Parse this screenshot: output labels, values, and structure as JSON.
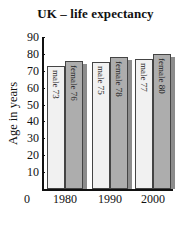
{
  "chart_data": {
    "type": "bar",
    "title": "UK – life expectancy",
    "xlabel": "",
    "ylabel": "Age in years",
    "categories": [
      "1980",
      "1990",
      "2000"
    ],
    "series": [
      {
        "name": "male",
        "values": [
          73,
          75,
          77
        ],
        "color": "#f1f1f1"
      },
      {
        "name": "female",
        "values": [
          76,
          78,
          80
        ],
        "color": "#adadad"
      }
    ],
    "bar_labels": [
      [
        "male 73",
        "female 76"
      ],
      [
        "male 75",
        "female 78"
      ],
      [
        "male 77",
        "female 80"
      ]
    ],
    "yticks": [
      0,
      10,
      20,
      30,
      40,
      50,
      60,
      70,
      80,
      90
    ],
    "ylim": [
      0,
      90
    ],
    "grid": false,
    "legend": "none (labels inside bars)"
  }
}
